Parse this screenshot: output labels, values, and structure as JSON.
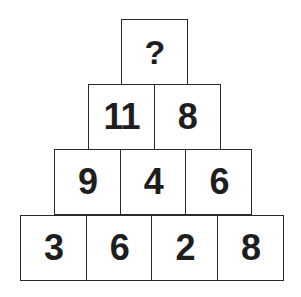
{
  "puzzle": {
    "type": "number-pyramid",
    "rows": [
      [
        "?"
      ],
      [
        "11",
        "8"
      ],
      [
        "9",
        "4",
        "6"
      ],
      [
        "3",
        "6",
        "2",
        "8"
      ]
    ]
  },
  "colors": {
    "border": "#2a2a2a",
    "text": "#1e1e1e",
    "background": "#ffffff"
  }
}
